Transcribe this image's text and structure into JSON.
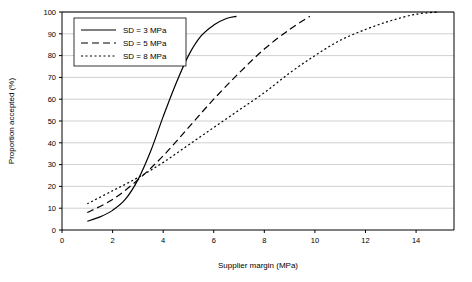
{
  "chart_data": {
    "type": "line",
    "title": "",
    "xlabel": "Supplier margin (MPa)",
    "ylabel": "Proportion accepted (%)",
    "xlim": [
      0,
      15.5
    ],
    "ylim": [
      0,
      100
    ],
    "xticks": [
      0,
      2,
      4,
      6,
      8,
      10,
      12,
      14
    ],
    "yticks": [
      0,
      10,
      20,
      30,
      40,
      50,
      60,
      70,
      80,
      90,
      100
    ],
    "grid": "horizontal",
    "legend_position": "top-left",
    "series": [
      {
        "name": "SD = 3 MPa",
        "dash": "solid",
        "x": [
          1.0,
          1.5,
          2.0,
          2.5,
          3.0,
          3.5,
          4.0,
          4.5,
          5.0,
          5.5,
          6.0,
          6.5,
          6.9
        ],
        "y": [
          4,
          6,
          9,
          14,
          23,
          36,
          52,
          67,
          80,
          89,
          94,
          97,
          98
        ]
      },
      {
        "name": "SD = 5 MPa",
        "dash": "dashed",
        "x": [
          1.0,
          2.0,
          3.0,
          4.0,
          5.0,
          6.0,
          7.0,
          8.0,
          9.0,
          9.8
        ],
        "y": [
          8,
          14,
          23,
          34,
          47,
          60,
          72,
          83,
          92,
          98
        ]
      },
      {
        "name": "SD = 8 MPa",
        "dash": "dotted",
        "x": [
          1.0,
          2.0,
          3.0,
          4.0,
          5.0,
          6.0,
          7.0,
          8.0,
          9.0,
          10.0,
          11.0,
          12.0,
          13.0,
          14.0,
          14.9
        ],
        "y": [
          12,
          18,
          24,
          31,
          39,
          47,
          55,
          63,
          72,
          80,
          87,
          92,
          96,
          99,
          100
        ]
      }
    ]
  },
  "colors": {
    "line": "#000000",
    "grid": "#b0b0b0",
    "axis": "#000000",
    "background": "#ffffff"
  }
}
